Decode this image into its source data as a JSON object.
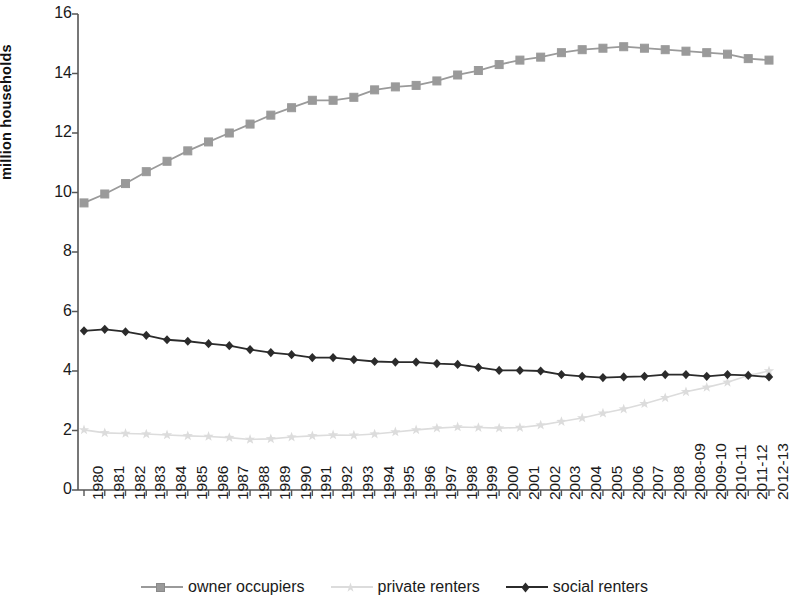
{
  "chart_data": {
    "type": "line",
    "title": "",
    "xlabel": "",
    "ylabel": "million households",
    "ylim": [
      0,
      16
    ],
    "ytick_step": 2,
    "yticks": [
      0,
      2,
      4,
      6,
      8,
      10,
      12,
      14,
      16
    ],
    "grid": false,
    "legend_position": "bottom",
    "categories": [
      "1980",
      "1981",
      "1982",
      "1983",
      "1984",
      "1985",
      "1986",
      "1987",
      "1988",
      "1989",
      "1990",
      "1991",
      "1992",
      "1993",
      "1994",
      "1995",
      "1996",
      "1997",
      "1998",
      "1999",
      "2000",
      "2001",
      "2002",
      "2003",
      "2004",
      "2005",
      "2006",
      "2007",
      "2008",
      "2008-09",
      "2009-10",
      "2010-11",
      "2011-12",
      "2012-13"
    ],
    "series": [
      {
        "name": "owner occupiers",
        "color": "#9a9a9a",
        "marker": "square",
        "values": [
          9.65,
          9.95,
          10.3,
          10.7,
          11.05,
          11.4,
          11.7,
          12.0,
          12.3,
          12.6,
          12.85,
          13.1,
          13.1,
          13.2,
          13.45,
          13.55,
          13.6,
          13.75,
          13.95,
          14.1,
          14.3,
          14.45,
          14.55,
          14.7,
          14.8,
          14.85,
          14.9,
          14.85,
          14.8,
          14.75,
          14.7,
          14.65,
          14.5,
          14.45
        ]
      },
      {
        "name": "private renters",
        "color": "#dcdcdc",
        "marker": "star",
        "values": [
          2.02,
          1.92,
          1.9,
          1.88,
          1.85,
          1.82,
          1.8,
          1.76,
          1.7,
          1.72,
          1.78,
          1.82,
          1.85,
          1.84,
          1.88,
          1.95,
          2.02,
          2.08,
          2.12,
          2.1,
          2.08,
          2.1,
          2.18,
          2.3,
          2.42,
          2.58,
          2.72,
          2.9,
          3.1,
          3.3,
          3.45,
          3.62,
          3.85,
          4.0
        ]
      },
      {
        "name": "social renters",
        "color": "#2b2b2b",
        "marker": "diamond",
        "values": [
          5.35,
          5.4,
          5.32,
          5.2,
          5.05,
          5.0,
          4.92,
          4.85,
          4.72,
          4.62,
          4.55,
          4.45,
          4.45,
          4.38,
          4.32,
          4.3,
          4.3,
          4.25,
          4.22,
          4.12,
          4.02,
          4.02,
          4.0,
          3.88,
          3.82,
          3.78,
          3.8,
          3.82,
          3.88,
          3.88,
          3.82,
          3.88,
          3.85,
          3.8
        ]
      }
    ]
  },
  "legend": {
    "items": [
      {
        "label": "owner occupiers"
      },
      {
        "label": "private renters"
      },
      {
        "label": "social renters"
      }
    ]
  },
  "axis": {
    "ylabel": "million households"
  }
}
